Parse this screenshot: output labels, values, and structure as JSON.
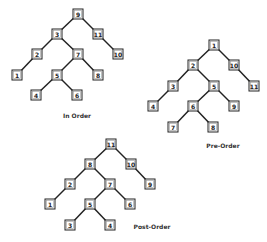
{
  "trees": [
    {
      "id": "in-order",
      "caption": "In Order",
      "caption_pos": [
        77,
        115
      ],
      "nodes": [
        {
          "key": "a",
          "label": "9",
          "x": 78,
          "y": 14
        },
        {
          "key": "b",
          "label": "3",
          "x": 57,
          "y": 34
        },
        {
          "key": "c",
          "label": "11",
          "x": 98,
          "y": 34
        },
        {
          "key": "d",
          "label": "2",
          "x": 37,
          "y": 54
        },
        {
          "key": "e",
          "label": "7",
          "x": 78,
          "y": 54
        },
        {
          "key": "f",
          "label": "10",
          "x": 118,
          "y": 54
        },
        {
          "key": "g",
          "label": "1",
          "x": 17,
          "y": 75
        },
        {
          "key": "h",
          "label": "5",
          "x": 57,
          "y": 75
        },
        {
          "key": "i",
          "label": "8",
          "x": 98,
          "y": 75
        },
        {
          "key": "j",
          "label": "4",
          "x": 36,
          "y": 95
        },
        {
          "key": "k",
          "label": "6",
          "x": 77,
          "y": 95
        }
      ],
      "edges": [
        [
          "a",
          "b"
        ],
        [
          "a",
          "c"
        ],
        [
          "b",
          "d"
        ],
        [
          "b",
          "e"
        ],
        [
          "c",
          "f"
        ],
        [
          "d",
          "g"
        ],
        [
          "e",
          "h"
        ],
        [
          "e",
          "i"
        ],
        [
          "h",
          "j"
        ],
        [
          "h",
          "k"
        ]
      ]
    },
    {
      "id": "pre-order",
      "caption": "Pre-Order",
      "caption_pos": [
        223,
        145
      ],
      "nodes": [
        {
          "key": "a",
          "label": "1",
          "x": 214,
          "y": 45
        },
        {
          "key": "b",
          "label": "2",
          "x": 193,
          "y": 65
        },
        {
          "key": "c",
          "label": "10",
          "x": 234,
          "y": 65
        },
        {
          "key": "d",
          "label": "3",
          "x": 173,
          "y": 86
        },
        {
          "key": "e",
          "label": "5",
          "x": 214,
          "y": 86
        },
        {
          "key": "f",
          "label": "11",
          "x": 254,
          "y": 86
        },
        {
          "key": "g",
          "label": "4",
          "x": 153,
          "y": 106
        },
        {
          "key": "h",
          "label": "6",
          "x": 193,
          "y": 106
        },
        {
          "key": "i",
          "label": "9",
          "x": 234,
          "y": 106
        },
        {
          "key": "j",
          "label": "7",
          "x": 173,
          "y": 127
        },
        {
          "key": "k",
          "label": "8",
          "x": 213,
          "y": 127
        }
      ],
      "edges": [
        [
          "a",
          "b"
        ],
        [
          "a",
          "c"
        ],
        [
          "b",
          "d"
        ],
        [
          "b",
          "e"
        ],
        [
          "c",
          "f"
        ],
        [
          "d",
          "g"
        ],
        [
          "e",
          "h"
        ],
        [
          "e",
          "i"
        ],
        [
          "h",
          "j"
        ],
        [
          "h",
          "k"
        ]
      ]
    },
    {
      "id": "post-order",
      "caption": "Post-Order",
      "caption_pos": [
        152,
        226
      ],
      "nodes": [
        {
          "key": "a",
          "label": "11",
          "x": 111,
          "y": 144
        },
        {
          "key": "b",
          "label": "8",
          "x": 90,
          "y": 164
        },
        {
          "key": "c",
          "label": "10",
          "x": 131,
          "y": 164
        },
        {
          "key": "d",
          "label": "2",
          "x": 70,
          "y": 184
        },
        {
          "key": "e",
          "label": "7",
          "x": 110,
          "y": 184
        },
        {
          "key": "f",
          "label": "9",
          "x": 150,
          "y": 184
        },
        {
          "key": "g",
          "label": "1",
          "x": 50,
          "y": 204
        },
        {
          "key": "h",
          "label": "5",
          "x": 90,
          "y": 204
        },
        {
          "key": "i",
          "label": "6",
          "x": 130,
          "y": 204
        },
        {
          "key": "j",
          "label": "3",
          "x": 70,
          "y": 225
        },
        {
          "key": "k",
          "label": "4",
          "x": 110,
          "y": 225
        }
      ],
      "edges": [
        [
          "a",
          "b"
        ],
        [
          "a",
          "c"
        ],
        [
          "b",
          "d"
        ],
        [
          "b",
          "e"
        ],
        [
          "c",
          "f"
        ],
        [
          "d",
          "g"
        ],
        [
          "e",
          "h"
        ],
        [
          "e",
          "i"
        ],
        [
          "h",
          "j"
        ],
        [
          "h",
          "k"
        ]
      ]
    }
  ],
  "style": {
    "box_size": 10,
    "line_color": "#222222",
    "background": "#ffffff"
  }
}
